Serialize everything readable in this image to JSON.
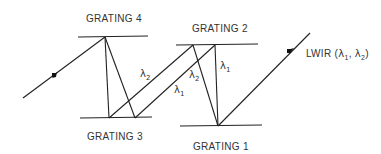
{
  "diagram": {
    "gratings": [
      {
        "label": "GRATING 1"
      },
      {
        "label": "GRATING 2"
      },
      {
        "label": "GRATING 3"
      },
      {
        "label": "GRATING 4"
      }
    ],
    "input_beam": {
      "label": "LWIR",
      "wavelengths": "(λ1, λ2)",
      "l1": "λ",
      "l1sub": "1",
      "sep": ", ",
      "l2": "λ",
      "l2sub": "2",
      "open": "(",
      "close": ")"
    },
    "wavelength_labels": {
      "lambda": "λ",
      "one": "1",
      "two": "2"
    }
  }
}
